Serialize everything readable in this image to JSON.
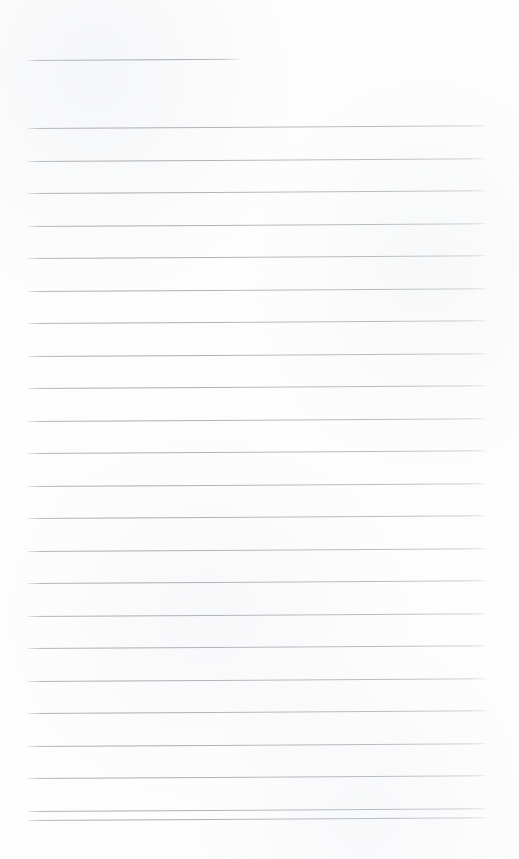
{
  "document": {
    "kind": "scanned-blank-ruled-page",
    "description": "Blank lined notebook page, scanned",
    "text_content": "",
    "has_handwriting": false,
    "has_printed_text": false
  },
  "canvas": {
    "width": 519,
    "height": 859,
    "background_color": "#fdfdfd"
  },
  "ruling": {
    "line_color": "#b0b4ba",
    "line_thickness_px": 1,
    "line_spacing_px": 32.5,
    "left_margin_px": 28,
    "right_edge_px": 486,
    "skew_degrees": -0.33,
    "total_lines": 24,
    "lines": [
      {
        "index": 1,
        "y": 60,
        "x_start": 28,
        "x_end": 241,
        "variant": "short"
      },
      {
        "index": 2,
        "y": 128,
        "x_start": 28,
        "x_end": 486,
        "variant": "full"
      },
      {
        "index": 3,
        "y": 160.5,
        "x_start": 28,
        "x_end": 486,
        "variant": "full"
      },
      {
        "index": 4,
        "y": 193,
        "x_start": 28,
        "x_end": 486,
        "variant": "full"
      },
      {
        "index": 5,
        "y": 225.5,
        "x_start": 28,
        "x_end": 486,
        "variant": "full"
      },
      {
        "index": 6,
        "y": 258,
        "x_start": 28,
        "x_end": 486,
        "variant": "full"
      },
      {
        "index": 7,
        "y": 290.5,
        "x_start": 28,
        "x_end": 486,
        "variant": "full"
      },
      {
        "index": 8,
        "y": 323,
        "x_start": 28,
        "x_end": 486,
        "variant": "full"
      },
      {
        "index": 9,
        "y": 355.5,
        "x_start": 28,
        "x_end": 486,
        "variant": "full"
      },
      {
        "index": 10,
        "y": 388,
        "x_start": 28,
        "x_end": 486,
        "variant": "full"
      },
      {
        "index": 11,
        "y": 420.5,
        "x_start": 28,
        "x_end": 486,
        "variant": "full"
      },
      {
        "index": 12,
        "y": 453,
        "x_start": 28,
        "x_end": 486,
        "variant": "full"
      },
      {
        "index": 13,
        "y": 485.5,
        "x_start": 28,
        "x_end": 486,
        "variant": "full"
      },
      {
        "index": 14,
        "y": 518,
        "x_start": 28,
        "x_end": 486,
        "variant": "full"
      },
      {
        "index": 15,
        "y": 550.5,
        "x_start": 28,
        "x_end": 486,
        "variant": "full"
      },
      {
        "index": 16,
        "y": 583,
        "x_start": 28,
        "x_end": 486,
        "variant": "full"
      },
      {
        "index": 17,
        "y": 615.5,
        "x_start": 28,
        "x_end": 486,
        "variant": "full"
      },
      {
        "index": 18,
        "y": 648,
        "x_start": 28,
        "x_end": 486,
        "variant": "full"
      },
      {
        "index": 19,
        "y": 680.5,
        "x_start": 28,
        "x_end": 486,
        "variant": "full"
      },
      {
        "index": 20,
        "y": 713,
        "x_start": 28,
        "x_end": 486,
        "variant": "full"
      },
      {
        "index": 21,
        "y": 745.5,
        "x_start": 28,
        "x_end": 486,
        "variant": "full"
      },
      {
        "index": 22,
        "y": 778,
        "x_start": 28,
        "x_end": 486,
        "variant": "full"
      },
      {
        "index": 23,
        "y": 810.5,
        "x_start": 28,
        "x_end": 486,
        "variant": "full"
      },
      {
        "index": 24,
        "y": 820,
        "x_start": 28,
        "x_end": 486,
        "variant": "full"
      }
    ]
  }
}
